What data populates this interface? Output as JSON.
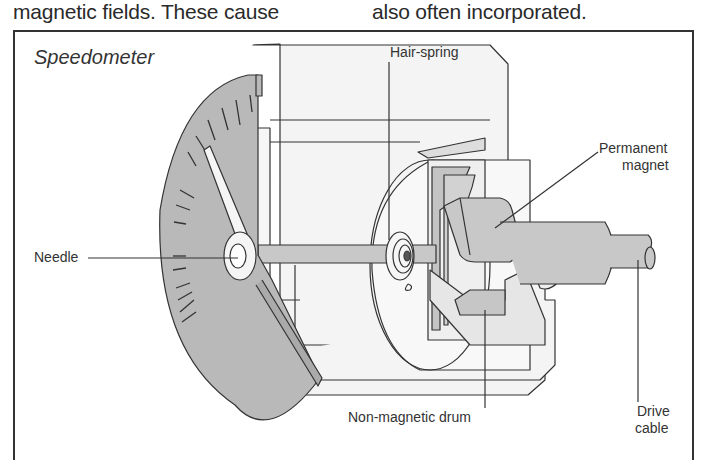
{
  "page_text": {
    "left_column_line": "magnetic fields. These cause",
    "right_column_line": "also often incorporated."
  },
  "figure": {
    "title": "Speedometer",
    "labels": {
      "hair_spring": "Hair-spring",
      "permanent_magnet_1": "Permanent",
      "permanent_magnet_2": "magnet",
      "needle": "Needle",
      "non_magnetic_drum": "Non-magnetic drum",
      "drive_cable_1": "Drive",
      "drive_cable_2": "cable"
    },
    "colors": {
      "outline": "#333333",
      "dial_fill": "#b9b9b9",
      "metal_fill": "#c8c8c8",
      "housing_fill": "#f4f4f4"
    }
  }
}
